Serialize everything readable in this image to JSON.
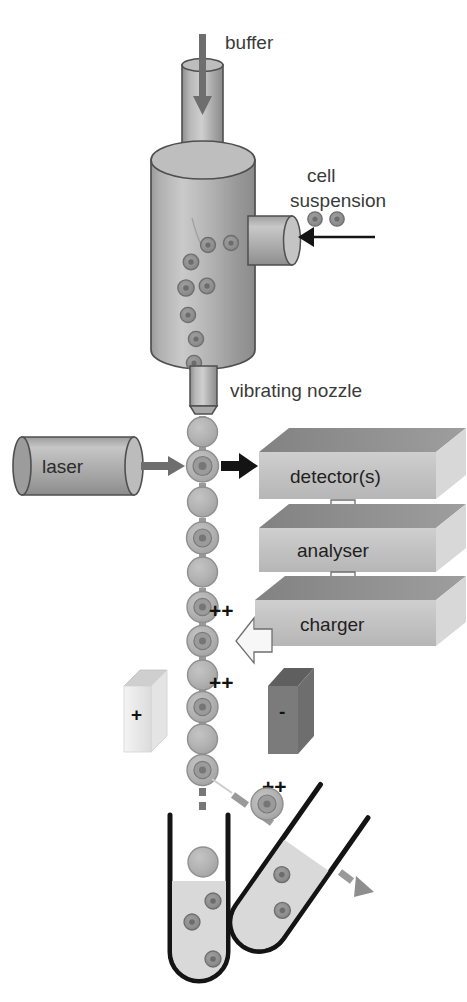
{
  "figure": {
    "background_color": "#ffffff"
  },
  "labels": {
    "buffer": "buffer",
    "cell_suspension_line1": "cell",
    "cell_suspension_line2": "suspension",
    "vibrating_nozzle": "vibrating nozzle",
    "laser": "laser",
    "detectors": "detector(s)",
    "analyser": "analyser",
    "charger": "charger",
    "plate_positive": "+",
    "plate_negative": "-",
    "charge_marker_1": "++",
    "charge_marker_2": "++",
    "charge_marker_3": "++"
  },
  "colors": {
    "body_fill": "#a8a8a8",
    "body_light": "#c9c9c9",
    "body_dark": "#8d8d8d",
    "outline": "#4a4a4a",
    "box_face": "#c2c2c2",
    "box_top": "#8f8f8f",
    "box_side": "#d8d8d8",
    "plate_positive_fill": "#eeeeee",
    "plate_negative_fill": "#777777",
    "arrow_gray": "#6e6e6e",
    "arrow_black": "#141414",
    "droplet_fill": "#b4b4b4",
    "cell_core": "#8a8a8a",
    "liquid_fill": "#d7d7d7",
    "tube_outline": "#141414",
    "text": "#3a3a3a"
  },
  "components": {
    "buffer_inlet": {
      "name": "buffer inlet tube",
      "arrow_direction": "down"
    },
    "sheath_chamber": {
      "name": "sheath fluid chamber",
      "shape": "cylinder"
    },
    "sample_inlet": {
      "name": "cell suspension inlet port",
      "arrow_direction": "left"
    },
    "nozzle": {
      "name": "vibrating nozzle"
    },
    "laser_source": {
      "name": "laser",
      "shape": "cylinder",
      "beam_direction": "right"
    },
    "detector_box": {
      "name": "detector(s)",
      "shape": "3d-box"
    },
    "analyser_box": {
      "name": "analyser",
      "shape": "3d-box"
    },
    "charger_box": {
      "name": "charger",
      "shape": "3d-box"
    },
    "deflection_plate_left": {
      "name": "positive deflection plate",
      "charge": "+"
    },
    "deflection_plate_right": {
      "name": "negative deflection plate",
      "charge": "-"
    },
    "collection_tube_left": {
      "name": "waste / uncharged collection tube",
      "orientation": "vertical"
    },
    "collection_tube_right": {
      "name": "sorted cell collection tube",
      "orientation": "tilted"
    }
  },
  "flow": {
    "droplet_count": 14,
    "charged_droplet_markers": 3,
    "arrows": [
      {
        "from": "detector(s)",
        "to": "analyser",
        "style": "white-outline-down"
      },
      {
        "from": "analyser",
        "to": "charger",
        "style": "white-outline-down"
      },
      {
        "from": "charger",
        "to": "droplet stream",
        "style": "white-outline-left"
      },
      {
        "from": "laser",
        "to": "interrogation point",
        "style": "solid-gray-right"
      },
      {
        "from": "interrogation point",
        "to": "detector(s)",
        "style": "solid-black-right"
      }
    ]
  }
}
